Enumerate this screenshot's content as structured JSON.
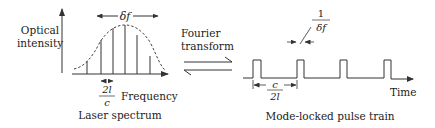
{
  "left_panel": {
    "y_label_line1": "Optical",
    "y_label_line2": "intensity",
    "x_label": "Frequency",
    "caption": "Laser spectrum",
    "bandwidth_label": "δf",
    "mode_spacing_numerator": "2l",
    "mode_spacing_denominator": "c"
  },
  "center": {
    "label_line1": "Fourier",
    "label_line2": "transform",
    "arrow": "equilibrium-harpoons"
  },
  "right_panel": {
    "x_label": "Time",
    "caption": "Mode-locked pulse train",
    "pulse_width_numerator": "1",
    "pulse_width_denominator": "δf",
    "period_numerator": "c",
    "period_denominator": "2l"
  },
  "colors": {
    "stroke": "#333333",
    "text": "#222222",
    "background": "#ffffff"
  }
}
